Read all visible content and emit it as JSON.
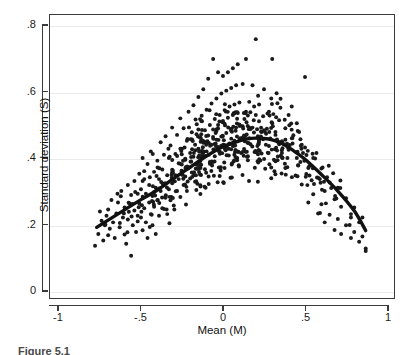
{
  "chart_data": {
    "type": "scatter",
    "title": "",
    "xlabel": "Mean (M)",
    "ylabel": "Standard deviation (S)",
    "xlim": [
      -1,
      1
    ],
    "ylim": [
      0,
      0.8
    ],
    "xticks": [
      -1,
      -0.5,
      0,
      0.5,
      1
    ],
    "xticklabels": [
      "-1",
      "-.5",
      "0",
      ".5",
      "1"
    ],
    "yticks": [
      0,
      0.2,
      0.4,
      0.6,
      0.8
    ],
    "yticklabels": [
      "0",
      ".2",
      ".4",
      ".6",
      ".8"
    ],
    "grid": "horizontal",
    "legend": "none",
    "marker_color": "#1a1a1a",
    "marker_size": 4,
    "n_points": 640,
    "series": [
      {
        "name": "Observations",
        "type": "scatter",
        "x_range": [
          -0.78,
          0.88
        ],
        "y_range": [
          0.1,
          0.76
        ]
      },
      {
        "name": "Fitted curve",
        "type": "line",
        "color": "#111111",
        "linewidth": 3.4,
        "x": [
          -0.77,
          -0.7,
          -0.6,
          -0.5,
          -0.4,
          -0.3,
          -0.2,
          -0.1,
          0.0,
          0.1,
          0.15,
          0.2,
          0.25,
          0.3,
          0.35,
          0.4,
          0.45,
          0.5,
          0.6,
          0.7,
          0.8,
          0.87
        ],
        "y": [
          0.19,
          0.212,
          0.243,
          0.274,
          0.303,
          0.338,
          0.372,
          0.406,
          0.434,
          0.452,
          0.458,
          0.46,
          0.459,
          0.455,
          0.446,
          0.432,
          0.415,
          0.396,
          0.35,
          0.3,
          0.24,
          0.18
        ]
      }
    ],
    "points": [
      [
        -0.78,
        0.134
      ],
      [
        -0.76,
        0.17
      ],
      [
        -0.75,
        0.238
      ],
      [
        -0.74,
        0.21
      ],
      [
        -0.73,
        0.15
      ],
      [
        -0.72,
        0.196
      ],
      [
        -0.71,
        0.225
      ],
      [
        -0.7,
        0.166
      ],
      [
        -0.7,
        0.244
      ],
      [
        -0.69,
        0.186
      ],
      [
        -0.68,
        0.273
      ],
      [
        -0.67,
        0.205
      ],
      [
        -0.66,
        0.158
      ],
      [
        -0.65,
        0.232
      ],
      [
        -0.64,
        0.265
      ],
      [
        -0.63,
        0.19
      ],
      [
        -0.62,
        0.3
      ],
      [
        -0.61,
        0.22
      ],
      [
        -0.6,
        0.168
      ],
      [
        -0.6,
        0.25
      ],
      [
        -0.59,
        0.14
      ],
      [
        -0.58,
        0.318
      ],
      [
        -0.58,
        0.214
      ],
      [
        -0.57,
        0.262
      ],
      [
        -0.56,
        0.104
      ],
      [
        -0.56,
        0.288
      ],
      [
        -0.55,
        0.196
      ],
      [
        -0.54,
        0.33
      ],
      [
        -0.54,
        0.241
      ],
      [
        -0.53,
        0.176
      ],
      [
        -0.52,
        0.292
      ],
      [
        -0.52,
        0.208
      ],
      [
        -0.51,
        0.352
      ],
      [
        -0.51,
        0.262
      ],
      [
        -0.5,
        0.22
      ],
      [
        -0.5,
        0.305
      ],
      [
        -0.49,
        0.181
      ],
      [
        -0.49,
        0.4
      ],
      [
        -0.48,
        0.248
      ],
      [
        -0.48,
        0.336
      ],
      [
        -0.47,
        0.205
      ],
      [
        -0.47,
        0.292
      ],
      [
        -0.46,
        0.158
      ],
      [
        -0.46,
        0.382
      ],
      [
        -0.45,
        0.265
      ],
      [
        -0.45,
        0.318
      ],
      [
        -0.44,
        0.23
      ],
      [
        -0.44,
        0.42
      ],
      [
        -0.43,
        0.285
      ],
      [
        -0.43,
        0.196
      ],
      [
        -0.42,
        0.358
      ],
      [
        -0.42,
        0.252
      ],
      [
        -0.41,
        0.31
      ],
      [
        -0.41,
        0.17
      ],
      [
        -0.4,
        0.392
      ],
      [
        -0.4,
        0.272
      ],
      [
        -0.39,
        0.336
      ],
      [
        -0.39,
        0.225
      ],
      [
        -0.38,
        0.448
      ],
      [
        -0.38,
        0.3
      ],
      [
        -0.37,
        0.365
      ],
      [
        -0.37,
        0.248
      ],
      [
        -0.36,
        0.41
      ],
      [
        -0.36,
        0.318
      ],
      [
        -0.35,
        0.282
      ],
      [
        -0.35,
        0.466
      ],
      [
        -0.34,
        0.348
      ],
      [
        -0.34,
        0.23
      ],
      [
        -0.33,
        0.4
      ],
      [
        -0.33,
        0.305
      ],
      [
        -0.32,
        0.438
      ],
      [
        -0.32,
        0.272
      ],
      [
        -0.31,
        0.356
      ],
      [
        -0.31,
        0.492
      ],
      [
        -0.3,
        0.33
      ],
      [
        -0.3,
        0.256
      ],
      [
        -0.29,
        0.412
      ],
      [
        -0.29,
        0.348
      ],
      [
        -0.28,
        0.47
      ],
      [
        -0.28,
        0.3
      ],
      [
        -0.27,
        0.384
      ],
      [
        -0.27,
        0.336
      ],
      [
        -0.26,
        0.52
      ],
      [
        -0.26,
        0.282
      ],
      [
        -0.25,
        0.428
      ],
      [
        -0.25,
        0.36
      ],
      [
        -0.24,
        0.318
      ],
      [
        -0.24,
        0.49
      ],
      [
        -0.23,
        0.398
      ],
      [
        -0.23,
        0.344
      ],
      [
        -0.22,
        0.452
      ],
      [
        -0.22,
        0.3
      ],
      [
        -0.21,
        0.54
      ],
      [
        -0.21,
        0.372
      ],
      [
        -0.2,
        0.415
      ],
      [
        -0.2,
        0.338
      ],
      [
        -0.19,
        0.478
      ],
      [
        -0.19,
        0.356
      ],
      [
        -0.18,
        0.56
      ],
      [
        -0.18,
        0.404
      ],
      [
        -0.17,
        0.44
      ],
      [
        -0.17,
        0.328
      ],
      [
        -0.16,
        0.502
      ],
      [
        -0.16,
        0.38
      ],
      [
        -0.15,
        0.585
      ],
      [
        -0.15,
        0.428
      ],
      [
        -0.14,
        0.462
      ],
      [
        -0.14,
        0.35
      ],
      [
        -0.13,
        0.528
      ],
      [
        -0.13,
        0.4
      ],
      [
        -0.12,
        0.608
      ],
      [
        -0.12,
        0.446
      ],
      [
        -0.11,
        0.484
      ],
      [
        -0.11,
        0.366
      ],
      [
        -0.1,
        0.546
      ],
      [
        -0.1,
        0.42
      ],
      [
        -0.09,
        0.64
      ],
      [
        -0.09,
        0.468
      ],
      [
        -0.08,
        0.5
      ],
      [
        -0.08,
        0.388
      ],
      [
        -0.07,
        0.565
      ],
      [
        -0.07,
        0.44
      ],
      [
        -0.06,
        0.7
      ],
      [
        -0.06,
        0.486
      ],
      [
        -0.05,
        0.518
      ],
      [
        -0.05,
        0.405
      ],
      [
        -0.04,
        0.58
      ],
      [
        -0.04,
        0.455
      ],
      [
        -0.03,
        0.66
      ],
      [
        -0.03,
        0.5
      ],
      [
        -0.02,
        0.53
      ],
      [
        -0.02,
        0.42
      ],
      [
        -0.01,
        0.595
      ],
      [
        -0.01,
        0.465
      ],
      [
        0.0,
        0.648
      ],
      [
        0.0,
        0.512
      ],
      [
        0.01,
        0.545
      ],
      [
        0.01,
        0.432
      ],
      [
        0.02,
        0.604
      ],
      [
        0.02,
        0.476
      ],
      [
        0.03,
        0.66
      ],
      [
        0.03,
        0.522
      ],
      [
        0.04,
        0.556
      ],
      [
        0.04,
        0.444
      ],
      [
        0.05,
        0.612
      ],
      [
        0.05,
        0.486
      ],
      [
        0.06,
        0.672
      ],
      [
        0.06,
        0.53
      ],
      [
        0.07,
        0.562
      ],
      [
        0.07,
        0.452
      ],
      [
        0.08,
        0.62
      ],
      [
        0.08,
        0.492
      ],
      [
        0.09,
        0.684
      ],
      [
        0.09,
        0.536
      ],
      [
        0.1,
        0.568
      ],
      [
        0.1,
        0.458
      ],
      [
        0.12,
        0.624
      ],
      [
        0.12,
        0.496
      ],
      [
        0.14,
        0.7
      ],
      [
        0.14,
        0.54
      ],
      [
        0.16,
        0.57
      ],
      [
        0.16,
        0.46
      ],
      [
        0.18,
        0.62
      ],
      [
        0.18,
        0.492
      ],
      [
        0.2,
        0.76
      ],
      [
        0.2,
        0.53
      ],
      [
        0.22,
        0.562
      ],
      [
        0.22,
        0.452
      ],
      [
        0.25,
        0.608
      ],
      [
        0.25,
        0.484
      ],
      [
        0.28,
        0.54
      ],
      [
        0.28,
        0.436
      ],
      [
        0.3,
        0.7
      ],
      [
        0.3,
        0.505
      ],
      [
        0.32,
        0.47
      ],
      [
        0.32,
        0.39
      ],
      [
        0.35,
        0.552
      ],
      [
        0.35,
        0.448
      ],
      [
        0.38,
        0.49
      ],
      [
        0.38,
        0.37
      ],
      [
        0.4,
        0.53
      ],
      [
        0.4,
        0.425
      ],
      [
        0.42,
        0.46
      ],
      [
        0.42,
        0.342
      ],
      [
        0.45,
        0.505
      ],
      [
        0.45,
        0.4
      ],
      [
        0.48,
        0.44
      ],
      [
        0.48,
        0.32
      ],
      [
        0.5,
        0.645
      ],
      [
        0.5,
        0.432
      ],
      [
        0.52,
        0.37
      ],
      [
        0.52,
        0.265
      ],
      [
        0.55,
        0.4
      ],
      [
        0.55,
        0.29
      ],
      [
        0.58,
        0.34
      ],
      [
        0.58,
        0.232
      ],
      [
        0.6,
        0.368
      ],
      [
        0.6,
        0.26
      ],
      [
        0.62,
        0.3
      ],
      [
        0.62,
        0.205
      ],
      [
        0.65,
        0.326
      ],
      [
        0.65,
        0.228
      ],
      [
        0.68,
        0.275
      ],
      [
        0.68,
        0.182
      ],
      [
        0.7,
        0.31
      ],
      [
        0.7,
        0.215
      ],
      [
        0.72,
        0.252
      ],
      [
        0.72,
        0.17
      ],
      [
        0.75,
        0.278
      ],
      [
        0.75,
        0.196
      ],
      [
        0.78,
        0.23
      ],
      [
        0.78,
        0.158
      ],
      [
        0.8,
        0.25
      ],
      [
        0.8,
        0.176
      ],
      [
        0.83,
        0.205
      ],
      [
        0.83,
        0.146
      ],
      [
        0.85,
        0.22
      ],
      [
        0.85,
        0.162
      ],
      [
        0.87,
        0.126
      ],
      [
        0.87,
        0.118
      ]
    ]
  },
  "axes": {
    "x_title": "Mean (M)",
    "y_title": "Standard deviation (S)",
    "x_tick_labels": [
      "-1",
      "-.5",
      "0",
      ".5",
      "1"
    ],
    "y_tick_labels": [
      ".8",
      ".6",
      ".4",
      ".2",
      "0"
    ]
  },
  "caption": {
    "text": "Figure 5.1"
  },
  "colors": {
    "marker": "#1a1a1a",
    "curve": "#111111",
    "frame": "#3a3a3a",
    "grid": "#e9e9e9",
    "background": "#ffffff"
  }
}
